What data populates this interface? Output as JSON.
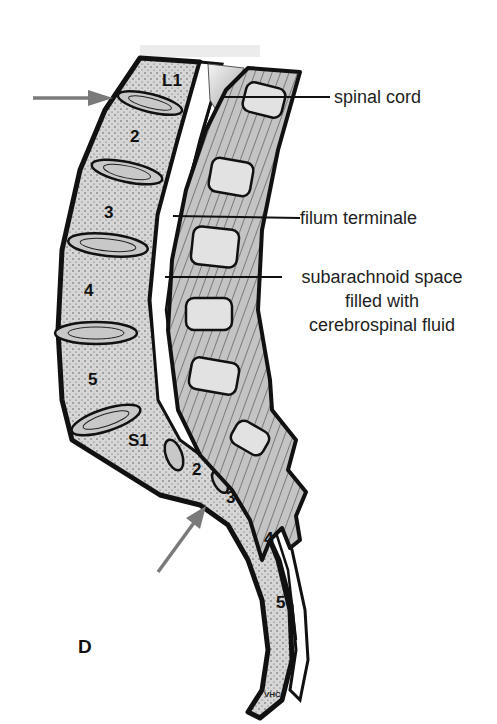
{
  "figure": {
    "panel_letter": "D",
    "signature": "VHC",
    "colors": {
      "bone_fill": "#d4d4d4",
      "outline": "#111111",
      "arrow": "#7a7a7a",
      "csf_space": "#ffffff",
      "ligament_fill": "#bdbdbd",
      "cord_gradient_light": "#f2f2f2",
      "cord_gradient_dark": "#a8a8a8"
    }
  },
  "labels": {
    "spinal_cord": "spinal cord",
    "filum_terminale": "filum terminale",
    "subarachnoid_line1": "subarachnoid space",
    "subarachnoid_line2": "filled with",
    "subarachnoid_line3": "cerebrospinal fluid"
  },
  "vertebrae": {
    "lumbar": [
      "L1",
      "2",
      "3",
      "4",
      "5"
    ],
    "sacral": [
      "S1",
      "2",
      "3",
      "4",
      "5"
    ]
  },
  "arrows": [
    {
      "name": "upper-arrow",
      "points_to": "L1-L2 disc level"
    },
    {
      "name": "lower-arrow",
      "points_to": "sacral region S2-S3"
    }
  ]
}
